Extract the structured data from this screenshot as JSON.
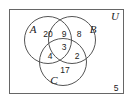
{
  "diagram": {
    "type": "venn",
    "universe_label": "U",
    "sets": [
      {
        "label": "A"
      },
      {
        "label": "B"
      },
      {
        "label": "C"
      }
    ],
    "regions": {
      "A_only": "20",
      "A_and_B_only": "9",
      "B_only": "8",
      "A_and_B_and_C": "3",
      "A_and_C_only": "4",
      "B_and_C_only": "2",
      "C_only": "17",
      "outside": "5"
    },
    "colors": {
      "stroke": "#555555",
      "text": "#222222",
      "background": "#ffffff"
    }
  }
}
